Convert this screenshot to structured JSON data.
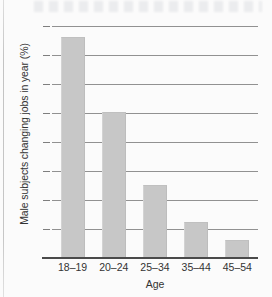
{
  "chart_data": {
    "type": "bar",
    "title": "",
    "subtitle": "",
    "xlabel": "Age",
    "ylabel": "Male subjects changing jobs in year (%)",
    "categories": [
      "18–19",
      "20–24",
      "25–34",
      "35–44",
      "45–54"
    ],
    "values": [
      38,
      25,
      12.5,
      6,
      3
    ],
    "series": [
      {
        "name": "Male subjects changing jobs in year (%)",
        "values": [
          38,
          25,
          12.5,
          6,
          3
        ]
      }
    ],
    "ylim": [
      0,
      40
    ],
    "ytick_values": [
      40,
      35,
      30,
      25,
      20,
      15,
      10,
      5,
      0
    ],
    "ytick_labels": [
      "40",
      "35",
      "30",
      "25",
      "20",
      "15",
      "10",
      "5",
      "0"
    ],
    "ytick_step": 5,
    "grid": "horizontal",
    "legend": "none",
    "orientation": "vertical",
    "bar_color": "#c7c7c7",
    "gridline_color": "#7e7e7e",
    "axis_color": "#4a4a4a",
    "text_color": "#333333",
    "background_color": "#fbfbfb"
  }
}
